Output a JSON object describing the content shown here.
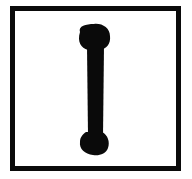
{
  "symbol": {
    "name": "bone-bar",
    "description": "thick vertical bar with rounded ends inside a square frame"
  },
  "colors": {
    "background": "#ffffff",
    "ink": "#0a0a0a"
  }
}
